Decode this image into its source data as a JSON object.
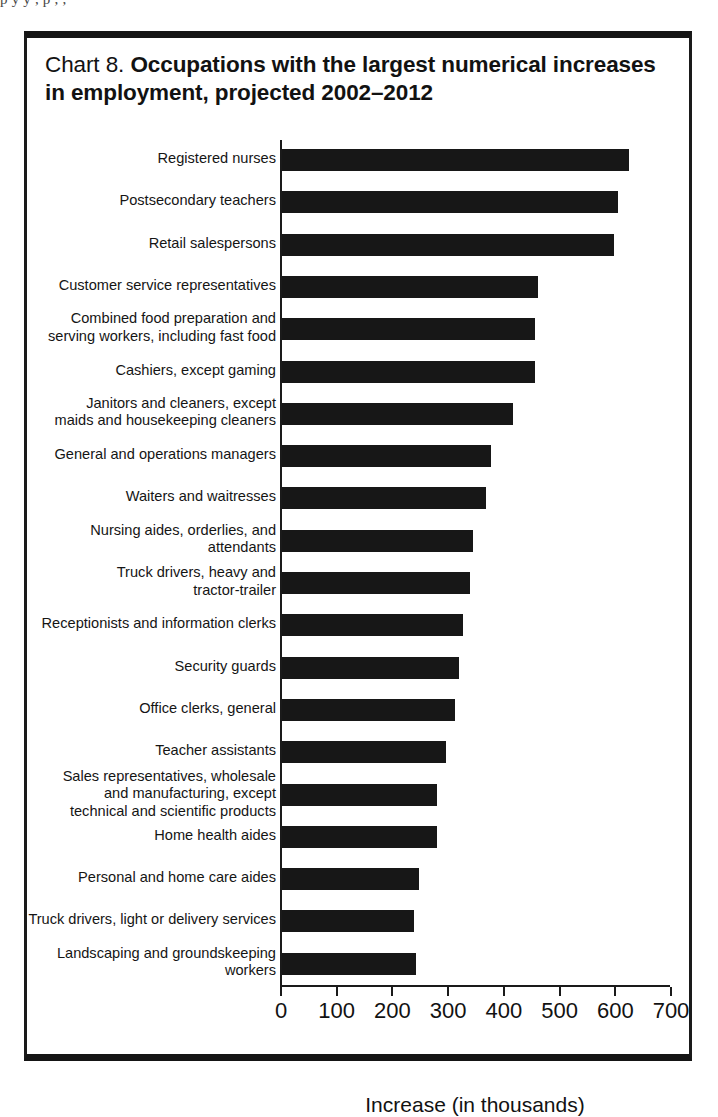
{
  "page_scrap_text": "p  y     y ,                                    p                                                                    ,     ,",
  "figure": {
    "title_prefix": "Chart 8.",
    "title_main": "Occupations with the largest numerical increases in employment, projected 2002–2012"
  },
  "chart_data": {
    "type": "bar",
    "orientation": "horizontal",
    "title": "Chart 8. Occupations with the largest numerical increases in employment, projected 2002–2012",
    "xlabel": "Increase (in thousands)",
    "ylabel": "",
    "xlim": [
      0,
      700
    ],
    "xticks": [
      0,
      100,
      200,
      300,
      400,
      500,
      600,
      700
    ],
    "xtick_labels": [
      "0",
      "100",
      "200",
      "300",
      "400",
      "500",
      "600",
      "700"
    ],
    "grid": false,
    "legend": null,
    "bar_color": "#171717",
    "categories": [
      "Registered nurses",
      "Postsecondary teachers",
      "Retail salespersons",
      "Customer service representatives",
      "Combined food preparation and serving workers, including fast food",
      "Cashiers, except gaming",
      "Janitors and cleaners, except maids and housekeeping cleaners",
      "General and operations managers",
      "Waiters and waitresses",
      "Nursing aides, orderlies, and attendants",
      "Truck drivers, heavy and tractor-trailer",
      "Receptionists and information clerks",
      "Security guards",
      "Office clerks, general",
      "Teacher assistants",
      "Sales representatives, wholesale and manufacturing, except technical and scientific products",
      "Home health aides",
      "Personal and home care aides",
      "Truck drivers, light or delivery services",
      "Landscaping and groundskeeping workers"
    ],
    "category_label_lines": [
      [
        "Registered nurses"
      ],
      [
        "Postsecondary teachers"
      ],
      [
        "Retail salespersons"
      ],
      [
        "Customer service representatives"
      ],
      [
        "Combined food preparation and",
        "serving workers, including fast food"
      ],
      [
        "Cashiers, except gaming"
      ],
      [
        "Janitors and cleaners, except",
        "maids and housekeeping cleaners"
      ],
      [
        "General and operations managers"
      ],
      [
        "Waiters and waitresses"
      ],
      [
        "Nursing aides, orderlies, and",
        "attendants"
      ],
      [
        "Truck drivers, heavy and",
        "tractor-trailer"
      ],
      [
        "Receptionists and information clerks"
      ],
      [
        "Security guards"
      ],
      [
        "Office clerks, general"
      ],
      [
        "Teacher assistants"
      ],
      [
        "Sales representatives, wholesale",
        "and manufacturing, except",
        "technical and scientific products"
      ],
      [
        "Home health aides"
      ],
      [
        "Personal and home care aides"
      ],
      [
        "Truck drivers, light or delivery services"
      ],
      [
        "Landscaping and groundskeeping",
        "workers"
      ]
    ],
    "values": [
      623,
      603,
      596,
      460,
      454,
      454,
      414,
      376,
      367,
      343,
      337,
      325,
      317,
      310,
      294,
      279,
      279,
      246,
      237,
      241
    ]
  }
}
